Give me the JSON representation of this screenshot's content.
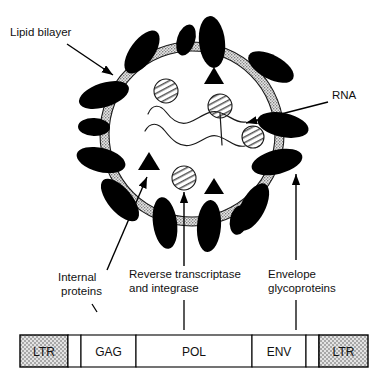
{
  "figure": {
    "type": "biological-schematic-diagram"
  },
  "callouts": [
    {
      "id": "lipid-bilayer",
      "label": "Lipid bilayer",
      "lines": [
        "Lipid bilayer"
      ],
      "points_to": "membrane-ring"
    },
    {
      "id": "rna",
      "label": "RNA",
      "lines": [
        "RNA"
      ],
      "points_to": "rna-strands"
    },
    {
      "id": "internal-proteins",
      "label": "Internal proteins",
      "lines": [
        "Internal",
        "proteins"
      ],
      "points_to": "capsid-triangle"
    },
    {
      "id": "reverse-transcriptase",
      "label": "Reverse transcriptase and integrase",
      "lines": [
        "Reverse transcriptase",
        "and integrase"
      ],
      "points_to": "hatched-circle"
    },
    {
      "id": "envelope-glycoproteins",
      "label": "Envelope glycoproteins",
      "lines": [
        "Envelope",
        "glycoproteins"
      ],
      "points_to": "black-ellipse"
    }
  ],
  "virion": {
    "membrane_name": "lipid-bilayer-ring",
    "membrane_fill": "#c8c8c8",
    "membrane_stroke": "#000000",
    "glycoprotein_count": 14,
    "glycoprotein_fill": "#000000",
    "internal_protein_count": 3,
    "internal_protein_fill": "#000000",
    "enzyme_circle_count": 4,
    "enzyme_circle_fill": "#ffffff",
    "rna_strand_count": 2
  },
  "genome": {
    "name": "provirus-genome-map",
    "segments": [
      {
        "id": "ltr-left",
        "label": "LTR",
        "shaded": true,
        "x": 20,
        "width": 48
      },
      {
        "id": "spacer-1",
        "label": "",
        "shaded": false,
        "x": 68,
        "width": 13
      },
      {
        "id": "gag",
        "label": "GAG",
        "shaded": false,
        "x": 81,
        "width": 55
      },
      {
        "id": "pol",
        "label": "POL",
        "shaded": false,
        "x": 136,
        "width": 116
      },
      {
        "id": "env",
        "label": "ENV",
        "shaded": false,
        "x": 252,
        "width": 54
      },
      {
        "id": "spacer-2",
        "label": "",
        "shaded": false,
        "x": 306,
        "width": 13
      },
      {
        "id": "ltr-right",
        "label": "LTR",
        "shaded": true,
        "x": 319,
        "width": 49
      }
    ],
    "shaded_fill": "#bfbfbf",
    "plain_fill": "#ffffff",
    "stroke": "#000000"
  },
  "colors": {
    "background": "#ffffff",
    "ink": "#000000",
    "membrane_gray": "#c8c8c8",
    "ltr_gray": "#bfbfbf"
  }
}
